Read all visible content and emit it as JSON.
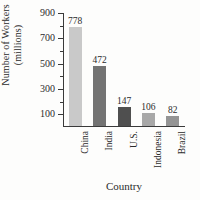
{
  "chart_data": {
    "type": "bar",
    "title": "",
    "xlabel": "Country",
    "ylabel": "Number of Workers (millions)",
    "ylabel_line1": "Number of Workers",
    "ylabel_line2": "(millions)",
    "categories": [
      "China",
      "India",
      "U.S.",
      "Indonesia",
      "Brazil"
    ],
    "values": [
      778,
      472,
      147,
      106,
      82
    ],
    "value_labels": [
      "778",
      "472",
      "147",
      "106",
      "82"
    ],
    "ylim": [
      0,
      900
    ],
    "y_major_ticks": [
      100,
      300,
      500,
      700,
      900
    ],
    "y_major_tick_labels": [
      "100",
      "300",
      "500",
      "700",
      "900"
    ],
    "y_minor_ticks": [
      200,
      400,
      600,
      800
    ],
    "grid": false,
    "legend": "none",
    "bar_colors": [
      "#c9c9c9",
      "#737373",
      "#4f4f4f",
      "#a8a8a8",
      "#949494"
    ],
    "axis_color": "#3a3a3a",
    "background_color": "#fdfdfc"
  }
}
